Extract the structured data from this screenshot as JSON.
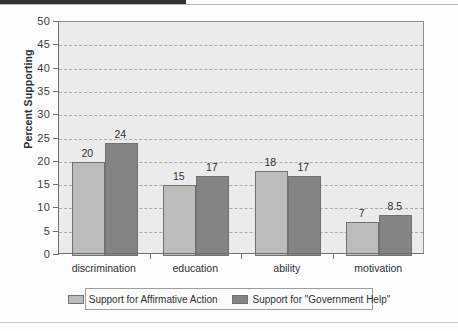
{
  "chart_data": {
    "type": "bar",
    "title": "",
    "xlabel": "",
    "ylabel": "Percent Supporting",
    "ylim": [
      0,
      50
    ],
    "ytick_step": 5,
    "yticks": [
      "50",
      "45",
      "40",
      "35",
      "30",
      "25",
      "20",
      "15",
      "10",
      "5",
      "0"
    ],
    "grid": true,
    "grid_style": "dashed-horizontal",
    "legend_position": "bottom",
    "categories": [
      "discrimination",
      "education",
      "ability",
      "motivation"
    ],
    "series": [
      {
        "name": "Support for Affirmative Action",
        "color": "#bcbcbc",
        "values": [
          20,
          15,
          18,
          7
        ],
        "labels": [
          "20",
          "15",
          "18",
          "7"
        ]
      },
      {
        "name": "Support for \"Government Help\"",
        "color": "#848484",
        "values": [
          24,
          17,
          17,
          8.5
        ],
        "labels": [
          "24",
          "17",
          "17",
          "8.5"
        ]
      }
    ]
  },
  "colors": {
    "series_a": "#bcbcbc",
    "series_b": "#848484",
    "plot_background": "#ebebeb",
    "axis": "#6e7072",
    "gridline": "#a9abad",
    "text": "#2f3133"
  },
  "legend": {
    "entries": [
      {
        "label": "Support for Affirmative Action"
      },
      {
        "label": "Support for \"Government Help\""
      }
    ]
  }
}
